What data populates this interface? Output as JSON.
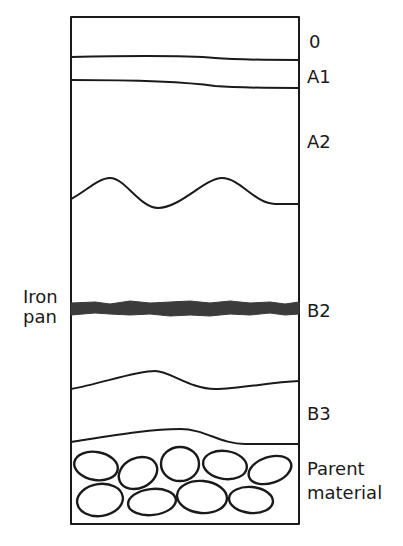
{
  "diagram": {
    "horizons": [
      {
        "id": "O",
        "label": "0"
      },
      {
        "id": "A1",
        "label": "A1"
      },
      {
        "id": "A2",
        "label": "A2"
      },
      {
        "id": "B2",
        "label": "B2"
      },
      {
        "id": "B3",
        "label": "B3"
      },
      {
        "id": "parent",
        "label_line1": "Parent",
        "label_line2": "material"
      }
    ],
    "iron_pan": {
      "label_line1": "Iron",
      "label_line2": "pan",
      "color": "#3b3b3b"
    },
    "parent_material_stones": {
      "top_row_count": 5,
      "bottom_row_count": 4
    },
    "line_color": "#1a1a1a"
  }
}
